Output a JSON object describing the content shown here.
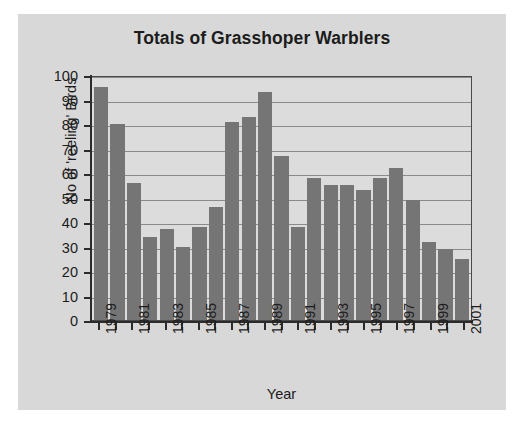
{
  "chart_data": {
    "type": "bar",
    "title": "Totals of Grasshoper Warblers",
    "xlabel": "Year",
    "ylabel": "No of 'reeling' Birds",
    "categories": [
      1979,
      1980,
      1981,
      1982,
      1983,
      1984,
      1985,
      1986,
      1987,
      1988,
      1989,
      1990,
      1991,
      1992,
      1993,
      1994,
      1995,
      1996,
      1997,
      1998,
      1999,
      2000,
      2001
    ],
    "values": [
      95,
      80,
      56,
      34,
      37,
      30,
      38,
      46,
      81,
      83,
      93,
      67,
      38,
      58,
      55,
      55,
      53,
      58,
      62,
      49,
      32,
      29,
      25
    ],
    "tick_labels_shown": [
      "1979",
      "",
      "1981",
      "",
      "1983",
      "",
      "1985",
      "",
      "1987",
      "",
      "1989",
      "",
      "1991",
      "",
      "1993",
      "",
      "1995",
      "",
      "1997",
      "",
      "1999",
      "",
      "2001"
    ],
    "ylim": [
      0,
      100
    ],
    "ytick_labels": [
      "100",
      "90",
      "80",
      "70",
      "60",
      "50",
      "40",
      "30",
      "20",
      "10",
      "0"
    ],
    "yticks": [
      100,
      90,
      80,
      70,
      60,
      50,
      40,
      30,
      20,
      10,
      0
    ],
    "grid": true,
    "legend": false,
    "bar_color": "#757575",
    "plot_bg_color": "#dcdcdc",
    "figure_bg_color": "#d8d8d8",
    "axis_color": "#2b2b2b",
    "gridline_color": "#8a8a8a"
  }
}
